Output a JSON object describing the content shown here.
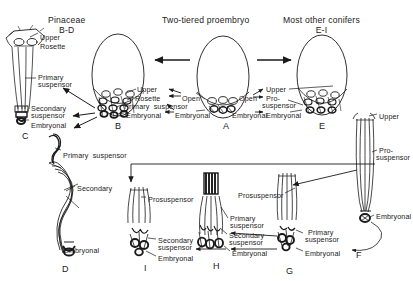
{
  "figure": {
    "headers": [
      {
        "id": "header-pinaceae",
        "line1": "Pinaceae",
        "line2": "B-D",
        "x": 48,
        "y": 16
      },
      {
        "id": "header-two-tiered",
        "line1": "Two-tiered proembryo",
        "line2": "",
        "x": 162,
        "y": 16
      },
      {
        "id": "header-other-conifers",
        "line1": "Most other conifers",
        "line2": "E-I",
        "x": 283,
        "y": 16
      }
    ],
    "stage_labels": [
      {
        "id": "stage-A",
        "text": "A",
        "x": 223,
        "y": 122
      },
      {
        "id": "stage-B",
        "text": "B",
        "x": 115,
        "y": 122
      },
      {
        "id": "stage-C",
        "text": "C",
        "x": 22,
        "y": 132
      },
      {
        "id": "stage-D",
        "text": "D",
        "x": 62,
        "y": 265
      },
      {
        "id": "stage-E",
        "text": "E",
        "x": 319,
        "y": 122
      },
      {
        "id": "stage-F",
        "text": "F",
        "x": 356,
        "y": 251
      },
      {
        "id": "stage-G",
        "text": "G",
        "x": 286,
        "y": 267
      },
      {
        "id": "stage-H",
        "text": "H",
        "x": 213,
        "y": 262
      },
      {
        "id": "stage-I",
        "text": "I",
        "x": 144,
        "y": 264
      }
    ],
    "annotations": [
      {
        "id": "ann-c-upper",
        "text": "Upper",
        "x": 40,
        "y": 34
      },
      {
        "id": "ann-c-rosette",
        "text": "Rosette",
        "x": 40,
        "y": 43
      },
      {
        "id": "ann-c-primary",
        "text": "Primary",
        "x": 38,
        "y": 74
      },
      {
        "id": "ann-c-primary2",
        "text": "suspensor",
        "x": 38,
        "y": 81
      },
      {
        "id": "ann-c-secondary",
        "text": "Secondary",
        "x": 31,
        "y": 105
      },
      {
        "id": "ann-c-secondary2",
        "text": "suspensor",
        "x": 31,
        "y": 112
      },
      {
        "id": "ann-c-embryonal",
        "text": "Embryonal",
        "x": 31,
        "y": 122
      },
      {
        "id": "ann-b-upper",
        "text": "Upper",
        "x": 137,
        "y": 86
      },
      {
        "id": "ann-b-rosette",
        "text": "Rosette",
        "x": 135,
        "y": 95
      },
      {
        "id": "ann-b-primary-susp",
        "text": "Primary  suspensor",
        "x": 124,
        "y": 103
      },
      {
        "id": "ann-b-embryonal",
        "text": "Embryonal",
        "x": 126,
        "y": 112
      },
      {
        "id": "ann-a-open-left",
        "text": "Open",
        "x": 182,
        "y": 95
      },
      {
        "id": "ann-a-embryonal-left",
        "text": "Embryonal",
        "x": 175,
        "y": 112
      },
      {
        "id": "ann-a-open-right",
        "text": "Open",
        "x": 239,
        "y": 95
      },
      {
        "id": "ann-a-embryonal-right",
        "text": "Embryonal",
        "x": 232,
        "y": 112
      },
      {
        "id": "ann-e-upper",
        "text": "Upper",
        "x": 266,
        "y": 86
      },
      {
        "id": "ann-e-pro",
        "text": "Pro-",
        "x": 266,
        "y": 95
      },
      {
        "id": "ann-e-suspensor",
        "text": "suspensor",
        "x": 262,
        "y": 102
      },
      {
        "id": "ann-e-embryonal",
        "text": "Embryonal",
        "x": 266,
        "y": 112
      },
      {
        "id": "ann-f-upper",
        "text": "Upper",
        "x": 379,
        "y": 113
      },
      {
        "id": "ann-f-pro",
        "text": "Pro-",
        "x": 379,
        "y": 147
      },
      {
        "id": "ann-f-suspensor",
        "text": "suspensor",
        "x": 376,
        "y": 154
      },
      {
        "id": "ann-f-embryonal",
        "text": "Embryonal",
        "x": 376,
        "y": 213
      },
      {
        "id": "ann-d-primary-susp",
        "text": "Primary  suspensor",
        "x": 63,
        "y": 152
      },
      {
        "id": "ann-d-secondary",
        "text": "Secondary",
        "x": 77,
        "y": 185
      },
      {
        "id": "ann-d-embryonal",
        "text": "Embryonal",
        "x": 64,
        "y": 247
      },
      {
        "id": "ann-i-prosuspensor",
        "text": "Prosuspensor",
        "x": 148,
        "y": 196
      },
      {
        "id": "ann-i-secondary",
        "text": "Secondary",
        "x": 158,
        "y": 237
      },
      {
        "id": "ann-i-secondary2",
        "text": "suspensor",
        "x": 158,
        "y": 244
      },
      {
        "id": "ann-i-embryonal",
        "text": "Embryonal",
        "x": 158,
        "y": 255
      },
      {
        "id": "ann-h-primary",
        "text": "Primary",
        "x": 230,
        "y": 215
      },
      {
        "id": "ann-h-primary2",
        "text": "suspensor",
        "x": 230,
        "y": 222
      },
      {
        "id": "ann-h-secondary",
        "text": "Secondary",
        "x": 229,
        "y": 232
      },
      {
        "id": "ann-h-secondary2",
        "text": "suspensor",
        "x": 229,
        "y": 239
      },
      {
        "id": "ann-h-embryonal",
        "text": "Embryonal",
        "x": 232,
        "y": 250
      },
      {
        "id": "ann-g-prosuspensor",
        "text": "Prosuspensor",
        "x": 238,
        "y": 192
      },
      {
        "id": "ann-g-primary",
        "text": "Primary",
        "x": 308,
        "y": 229
      },
      {
        "id": "ann-g-primary2",
        "text": "suspensor",
        "x": 305,
        "y": 236
      },
      {
        "id": "ann-g-embryonal",
        "text": "Embryonal",
        "x": 305,
        "y": 250
      }
    ],
    "colors": {
      "ink": "#1a1a1a",
      "background": "#ffffff"
    }
  }
}
